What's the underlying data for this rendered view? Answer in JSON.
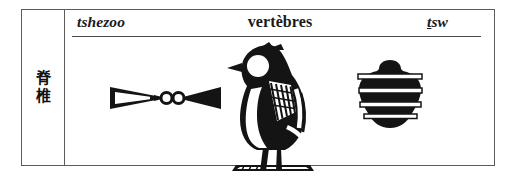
{
  "entry": {
    "gloss_cjk": "脊椎",
    "transliteration_left": "tshezoo",
    "meaning_fr": "vertèbres",
    "transliteration_right_prefix": "t",
    "transliteration_right_suffix": "sw",
    "transliteration_right_full": "ṯsw"
  },
  "glyphs": [
    {
      "name": "knot-bowtie-glyph",
      "description": "bowtie sign with double-loop knot"
    },
    {
      "name": "bird-glyph",
      "description": "standing bird with striped wing on ground line"
    },
    {
      "name": "vertebra-glyph",
      "description": "stacked vertebra sign with four horizontal bands"
    }
  ],
  "colors": {
    "ink": "#1a1a1a",
    "rule": "#4a4a4a",
    "border": "#5c5c5c",
    "background": "#ffffff"
  }
}
